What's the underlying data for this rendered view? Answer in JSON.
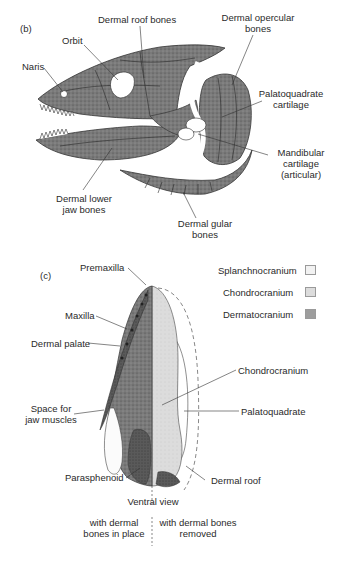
{
  "panel_b": {
    "tag": "(b)",
    "labels": {
      "naris": "Naris",
      "orbit": "Orbit",
      "dermal_roof_bones": "Dermal roof bones",
      "dermal_opercular_1": "Dermal opercular",
      "dermal_opercular_2": "bones",
      "palatoquadrate_1": "Palatoquadrate",
      "palatoquadrate_2": "cartilage",
      "mandibular_1": "Mandibular",
      "mandibular_2": "cartilage",
      "mandibular_3": "(articular)",
      "dermal_lower_1": "Dermal lower",
      "dermal_lower_2": "jaw bones",
      "dermal_gular_1": "Dermal gular",
      "dermal_gular_2": "bones"
    }
  },
  "panel_c": {
    "tag": "(c)",
    "labels": {
      "premaxilla": "Premaxilla",
      "maxilla": "Maxilla",
      "dermal_palate": "Dermal palate",
      "space_jaw_1": "Space for",
      "space_jaw_2": "jaw muscles",
      "parasphenoid": "Parasphenoid",
      "chondrocranium": "Chondrocranium",
      "palatoquadrate": "Palatoquadrate",
      "dermal_roof": "Dermal roof"
    },
    "view_title": "Ventral view",
    "left_caption_1": "with dermal",
    "left_caption_2": "bones in place",
    "right_caption_1": "with dermal bones",
    "right_caption_2": "removed"
  },
  "legend": {
    "items": [
      {
        "label": "Splanchnocranium",
        "fill": "#f2f2f2"
      },
      {
        "label": "Chondrocranium",
        "fill": "#dcdcdc"
      },
      {
        "label": "Dermatocranium",
        "fill": "#9d9d9d"
      }
    ]
  },
  "colors": {
    "dermal_dark": "#6e6e6e",
    "dermal_mid": "#8a8a8a",
    "chondro_light": "#d9d9d9",
    "line": "#333333"
  }
}
